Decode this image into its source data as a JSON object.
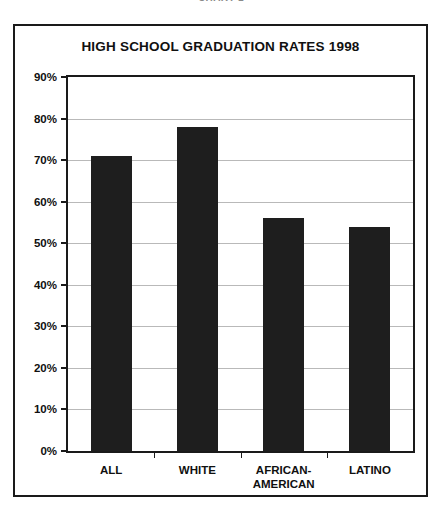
{
  "page": {
    "cut_header_text": "CHART 1"
  },
  "chart_data": {
    "type": "bar",
    "title": "HIGH SCHOOL GRADUATION RATES 1998",
    "xlabel": "",
    "ylabel": "",
    "ylim": [
      0,
      90
    ],
    "grid": true,
    "legend": "none",
    "categories": [
      "ALL",
      "WHITE",
      "AFRICAN-\nAMERICAN",
      "LATINO"
    ],
    "values": [
      71,
      78,
      56,
      54
    ],
    "ytick_labels": [
      "0%",
      "10%",
      "20%",
      "30%",
      "40%",
      "50%",
      "60%",
      "70%",
      "80%",
      "90%"
    ],
    "ytick_values": [
      0,
      10,
      20,
      30,
      40,
      50,
      60,
      70,
      80,
      90
    ],
    "colors": {
      "bar": "#1e1e1e",
      "axis": "#1a1a1a",
      "gridline": "#b9b9b9",
      "background": "#ffffff",
      "text": "#101010"
    }
  }
}
